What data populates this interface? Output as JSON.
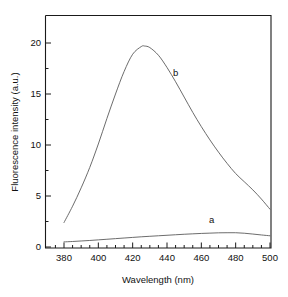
{
  "chart_data": {
    "type": "line",
    "title": "",
    "xlabel": "Wavelength (nm)",
    "ylabel": "Fluorescence intensity (a.u.)",
    "xlim": [
      374,
      506
    ],
    "ylim": [
      -0.4,
      22.8
    ],
    "xticks": [
      380,
      400,
      420,
      440,
      460,
      480,
      500
    ],
    "xtick_labels": [
      "380",
      "400",
      "420",
      "440",
      "460",
      "480",
      "500"
    ],
    "yticks": [
      0,
      5,
      10,
      15,
      20
    ],
    "ytick_labels": [
      "0",
      "5",
      "10",
      "15",
      "20"
    ],
    "xminor_step": 5,
    "yminor_step": 2.5,
    "grid": false,
    "legend_position": "inline-annotations",
    "annotations": [
      {
        "text": "b",
        "x": 445,
        "y": 16.8
      },
      {
        "text": "a",
        "x": 466,
        "y": 2.35
      }
    ],
    "series": [
      {
        "name": "a",
        "label": "a",
        "color": "#5b5b5b",
        "x": [
          380,
          385,
          390,
          395,
          400,
          405,
          410,
          415,
          420,
          425,
          430,
          435,
          440,
          445,
          450,
          455,
          460,
          465,
          470,
          475,
          480,
          485,
          490,
          495,
          500
        ],
        "values": [
          0.5,
          0.54,
          0.59,
          0.64,
          0.7,
          0.76,
          0.82,
          0.88,
          0.94,
          1.0,
          1.05,
          1.1,
          1.15,
          1.2,
          1.25,
          1.29,
          1.33,
          1.36,
          1.39,
          1.4,
          1.4,
          1.35,
          1.27,
          1.18,
          1.1
        ]
      },
      {
        "name": "b",
        "label": "b",
        "color": "#5b5b5b",
        "x": [
          380,
          385,
          390,
          395,
          400,
          405,
          410,
          415,
          420,
          425,
          427,
          430,
          435,
          440,
          445,
          450,
          455,
          460,
          465,
          470,
          475,
          480,
          485,
          490,
          495,
          500
        ],
        "values": [
          2.4,
          4.0,
          5.8,
          7.8,
          10.1,
          12.6,
          15.0,
          17.2,
          18.9,
          19.65,
          19.7,
          19.55,
          18.8,
          17.6,
          16.2,
          14.7,
          13.2,
          11.8,
          10.5,
          9.3,
          8.2,
          7.2,
          6.4,
          5.6,
          4.7,
          3.7
        ]
      }
    ],
    "peak_b": {
      "wavelength": 427,
      "intensity": 19.7
    },
    "peak_a": {
      "wavelength": 476,
      "intensity": 1.4
    }
  }
}
